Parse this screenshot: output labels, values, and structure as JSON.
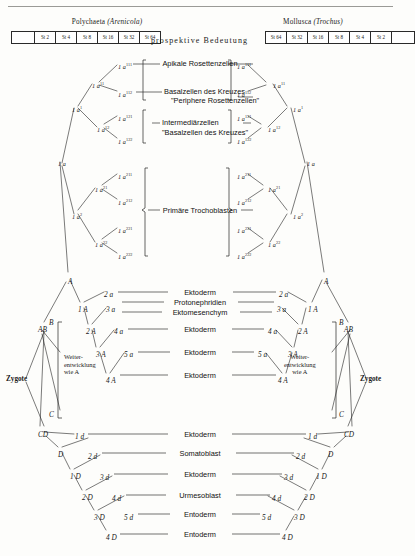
{
  "figure": {
    "center_header": "prospektive Bedeutung",
    "left_group": {
      "taxon": "Polychaeta",
      "genus": "Arenicola"
    },
    "right_group": {
      "taxon": "Mollusca",
      "genus": "Trochus"
    },
    "left_stages": [
      "",
      "St 2",
      "St 4",
      "St 8",
      "St 16",
      "St 32",
      "St 64"
    ],
    "right_stages": [
      "St 64",
      "St 32",
      "St 16",
      "St 8",
      "St 4",
      "St 2",
      ""
    ]
  },
  "fates": [
    {
      "id": "apikale",
      "text": "Apikale Rosettenzellen"
    },
    {
      "id": "basal1",
      "text": "Basalzellen des Kreuzes"
    },
    {
      "id": "basal2",
      "text": "\"Periphere Rosettenzellen\""
    },
    {
      "id": "intermediar",
      "text": "Intermediärzellen"
    },
    {
      "id": "basalkreuz",
      "text": "\"Basalzellen des Kreuzes\""
    },
    {
      "id": "trochoblasten",
      "text": "Primäre Trochoblasten"
    },
    {
      "id": "ektoderm_2a",
      "text": "Ektoderm"
    },
    {
      "id": "protonephridien",
      "text": "Protonephridien"
    },
    {
      "id": "ektomesenchym",
      "text": "Ektomesenchym"
    },
    {
      "id": "ektoderm_4a",
      "text": "Ektoderm"
    },
    {
      "id": "ektoderm_5a",
      "text": "Ektoderm"
    },
    {
      "id": "ektoderm_4A",
      "text": "Ektoderm"
    },
    {
      "id": "ektoderm_1d",
      "text": "Ektoderm"
    },
    {
      "id": "somatoblast",
      "text": "Somatoblast"
    },
    {
      "id": "ektoderm_3d",
      "text": "Ektoderm"
    },
    {
      "id": "urmesoblast",
      "text": "Urmesoblast"
    },
    {
      "id": "entoderm_5d",
      "text": "Entoderm"
    },
    {
      "id": "entoderm_4D",
      "text": "Entoderm"
    }
  ],
  "labels": {
    "zygote": "Zygote",
    "weiter_line1": "Weiter-",
    "weiter_line2": "entwicklung",
    "weiter_line3": "wie A",
    "quad_B": "B",
    "quad_C": "C"
  },
  "left_cells": [
    {
      "id": "l-1a111",
      "base": "1 a",
      "sup": "111",
      "x": 118,
      "y": 62
    },
    {
      "id": "l-1a11",
      "base": "1 a",
      "sup": "11",
      "x": 92,
      "y": 81
    },
    {
      "id": "l-1a112",
      "base": "1 a",
      "sup": "112",
      "x": 118,
      "y": 90
    },
    {
      "id": "l-1a121",
      "base": "1 a",
      "sup": "121",
      "x": 118,
      "y": 114
    },
    {
      "id": "l-1a12",
      "base": "1 a",
      "sup": "12",
      "x": 97,
      "y": 125
    },
    {
      "id": "l-1a122",
      "base": "1 a",
      "sup": "122",
      "x": 118,
      "y": 137
    },
    {
      "id": "l-1a1",
      "base": "1 a",
      "sup": "1",
      "x": 72,
      "y": 105
    },
    {
      "id": "l-1a211",
      "base": "1 a",
      "sup": "211",
      "x": 118,
      "y": 172
    },
    {
      "id": "l-1a21",
      "base": "1 a",
      "sup": "21",
      "x": 95,
      "y": 185
    },
    {
      "id": "l-1a212",
      "base": "1 a",
      "sup": "212",
      "x": 118,
      "y": 198
    },
    {
      "id": "l-1a2",
      "base": "1 a",
      "sup": "2",
      "x": 72,
      "y": 212
    },
    {
      "id": "l-1a221",
      "base": "1 a",
      "sup": "221",
      "x": 118,
      "y": 226
    },
    {
      "id": "l-1a22",
      "base": "1 a",
      "sup": "22",
      "x": 95,
      "y": 240
    },
    {
      "id": "l-1a222",
      "base": "1 a",
      "sup": "222",
      "x": 118,
      "y": 252
    },
    {
      "id": "l-1a",
      "base": "1 a",
      "sup": "",
      "x": 58,
      "y": 160
    }
  ],
  "right_cells": [
    {
      "id": "r-1a111",
      "base": "1 a",
      "sup": "111",
      "x": 237,
      "y": 62
    },
    {
      "id": "r-1a11",
      "base": "1 a",
      "sup": "11",
      "x": 273,
      "y": 81
    },
    {
      "id": "r-1a112",
      "base": "1 a",
      "sup": "112",
      "x": 237,
      "y": 90
    },
    {
      "id": "r-1a121",
      "base": "1 a",
      "sup": "121",
      "x": 237,
      "y": 114
    },
    {
      "id": "r-1a12",
      "base": "1 a",
      "sup": "12",
      "x": 268,
      "y": 125
    },
    {
      "id": "r-1a122",
      "base": "1 a",
      "sup": "122",
      "x": 237,
      "y": 137
    },
    {
      "id": "r-1a1",
      "base": "1 a",
      "sup": "1",
      "x": 293,
      "y": 105
    },
    {
      "id": "r-1a211",
      "base": "1 a",
      "sup": "211",
      "x": 237,
      "y": 172
    },
    {
      "id": "r-1a21",
      "base": "1 a",
      "sup": "21",
      "x": 268,
      "y": 185
    },
    {
      "id": "r-1a212",
      "base": "1 a",
      "sup": "212",
      "x": 237,
      "y": 198
    },
    {
      "id": "r-1a2",
      "base": "1 a",
      "sup": "2",
      "x": 293,
      "y": 212
    },
    {
      "id": "r-1a221",
      "base": "1 a",
      "sup": "221",
      "x": 237,
      "y": 226
    },
    {
      "id": "r-1a22",
      "base": "1 a",
      "sup": "22",
      "x": 268,
      "y": 240
    },
    {
      "id": "r-1a222",
      "base": "1 a",
      "sup": "222",
      "x": 237,
      "y": 252
    },
    {
      "id": "r-1a",
      "base": "1 a",
      "sup": "",
      "x": 307,
      "y": 160
    }
  ],
  "left_quad": [
    {
      "id": "lq-A",
      "text": "A",
      "x": 68,
      "y": 277
    },
    {
      "id": "lq-2a",
      "text": "2 a",
      "x": 104,
      "y": 290
    },
    {
      "id": "lq-1A",
      "text": "1 A",
      "x": 78,
      "y": 305
    },
    {
      "id": "lq-3a",
      "text": "3 a",
      "x": 106,
      "y": 305
    },
    {
      "id": "lq-2A",
      "text": "2 A",
      "x": 86,
      "y": 327
    },
    {
      "id": "lq-4a",
      "text": "4 a",
      "x": 114,
      "y": 327
    },
    {
      "id": "lq-3A",
      "text": "3 A",
      "x": 96,
      "y": 350
    },
    {
      "id": "lq-5a",
      "text": "5 a",
      "x": 124,
      "y": 350
    },
    {
      "id": "lq-4A",
      "text": "4 A",
      "x": 106,
      "y": 376
    },
    {
      "id": "lq-AB",
      "text": "AB",
      "x": 38,
      "y": 325
    },
    {
      "id": "lq-CD",
      "text": "CD",
      "x": 38,
      "y": 430
    },
    {
      "id": "lq-1d",
      "text": "1 d",
      "x": 75,
      "y": 432
    },
    {
      "id": "lq-D",
      "text": "D",
      "x": 58,
      "y": 450
    },
    {
      "id": "lq-2d",
      "text": "2 d",
      "x": 88,
      "y": 452
    },
    {
      "id": "lq-1D",
      "text": "1 D",
      "x": 70,
      "y": 472
    },
    {
      "id": "lq-3d",
      "text": "3 d",
      "x": 100,
      "y": 473
    },
    {
      "id": "lq-2D",
      "text": "2 D",
      "x": 82,
      "y": 493
    },
    {
      "id": "lq-4d",
      "text": "4 d",
      "x": 112,
      "y": 494
    },
    {
      "id": "lq-3D",
      "text": "3 D",
      "x": 94,
      "y": 513
    },
    {
      "id": "lq-5d",
      "text": "5 d",
      "x": 124,
      "y": 513
    },
    {
      "id": "lq-4D",
      "text": "4 D",
      "x": 106,
      "y": 533
    }
  ],
  "right_quad": [
    {
      "id": "rq-A",
      "text": "A",
      "x": 324,
      "y": 277
    },
    {
      "id": "rq-2a",
      "text": "2 a",
      "x": 279,
      "y": 290
    },
    {
      "id": "rq-1A",
      "text": "1 A",
      "x": 308,
      "y": 305
    },
    {
      "id": "rq-3a",
      "text": "3 a",
      "x": 277,
      "y": 305
    },
    {
      "id": "rq-2A",
      "text": "2 A",
      "x": 298,
      "y": 327
    },
    {
      "id": "rq-4a",
      "text": "4 a",
      "x": 268,
      "y": 327
    },
    {
      "id": "rq-3A",
      "text": "3 A",
      "x": 288,
      "y": 350
    },
    {
      "id": "rq-5a",
      "text": "5 a",
      "x": 258,
      "y": 350
    },
    {
      "id": "rq-4A",
      "text": "4 A",
      "x": 278,
      "y": 376
    },
    {
      "id": "rq-AB",
      "text": "AB",
      "x": 344,
      "y": 325
    },
    {
      "id": "rq-CD",
      "text": "CD",
      "x": 344,
      "y": 430
    },
    {
      "id": "rq-1d",
      "text": "1 d",
      "x": 308,
      "y": 432
    },
    {
      "id": "rq-D",
      "text": "D",
      "x": 328,
      "y": 450
    },
    {
      "id": "rq-2d",
      "text": "2 d",
      "x": 296,
      "y": 452
    },
    {
      "id": "rq-1D",
      "text": "1 D",
      "x": 316,
      "y": 472
    },
    {
      "id": "rq-3d",
      "text": "3 d",
      "x": 284,
      "y": 473
    },
    {
      "id": "rq-2D",
      "text": "2 D",
      "x": 304,
      "y": 493
    },
    {
      "id": "rq-4d",
      "text": "4 d",
      "x": 272,
      "y": 494
    },
    {
      "id": "rq-3D",
      "text": "3 D",
      "x": 294,
      "y": 513
    },
    {
      "id": "rq-5d",
      "text": "5 d",
      "x": 262,
      "y": 513
    },
    {
      "id": "rq-4D",
      "text": "4 D",
      "x": 282,
      "y": 533
    }
  ]
}
